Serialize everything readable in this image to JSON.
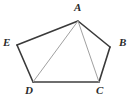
{
  "figure": {
    "kind": "geometry-diagram",
    "shape_name": "pentagon",
    "width": 134,
    "height": 106,
    "background_color": "#ffffff",
    "colors": {
      "outline_dark": "#3a3a3a",
      "base_edge_gray": "#6e6e6e",
      "diagonal_light": "#a0a0a0",
      "label_text": "#2b2b2b"
    },
    "vertices": [
      {
        "id": "A",
        "label": "A",
        "x": 78,
        "y": 21,
        "label_x": 74,
        "label_y": 2
      },
      {
        "id": "B",
        "label": "B",
        "x": 110,
        "y": 47,
        "label_x": 119,
        "label_y": 37
      },
      {
        "id": "C",
        "label": "C",
        "x": 99,
        "y": 82,
        "label_x": 96,
        "label_y": 85
      },
      {
        "id": "D",
        "label": "D",
        "x": 33,
        "y": 82,
        "label_x": 25,
        "label_y": 85
      },
      {
        "id": "E",
        "label": "E",
        "x": 17,
        "y": 45,
        "label_x": 3,
        "label_y": 37
      }
    ],
    "edges": [
      {
        "id": "A-B",
        "from": "A",
        "to": "B",
        "color": "#3a3a3a",
        "width": 1.6
      },
      {
        "id": "B-C",
        "from": "B",
        "to": "C",
        "color": "#3a3a3a",
        "width": 1.6
      },
      {
        "id": "C-D",
        "from": "C",
        "to": "D",
        "color": "#6e6e6e",
        "width": 1.9
      },
      {
        "id": "D-E",
        "from": "D",
        "to": "E",
        "color": "#3a3a3a",
        "width": 1.6
      },
      {
        "id": "E-A",
        "from": "E",
        "to": "A",
        "color": "#3a3a3a",
        "width": 1.6
      }
    ],
    "diagonals": [
      {
        "id": "A-D",
        "from": "A",
        "to": "D",
        "color": "#a0a0a0",
        "width": 1.0
      },
      {
        "id": "A-C",
        "from": "A",
        "to": "C",
        "color": "#a0a0a0",
        "width": 1.0
      }
    ]
  }
}
